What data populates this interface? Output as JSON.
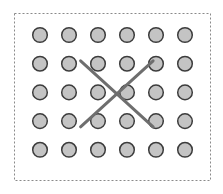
{
  "diagram": {
    "grid": {
      "rows": 5,
      "cols": 6
    },
    "colors": {
      "frame": "#8a8a8a",
      "dot_fill": "#c4c4c4",
      "dot_stroke": "#3c3c3c",
      "cross": "#6e6e6e",
      "background": "#ffffff"
    },
    "cross": {
      "from_col": 1.4,
      "to_col": 3.9,
      "from_row": 0.9,
      "to_row": 3.2
    }
  }
}
